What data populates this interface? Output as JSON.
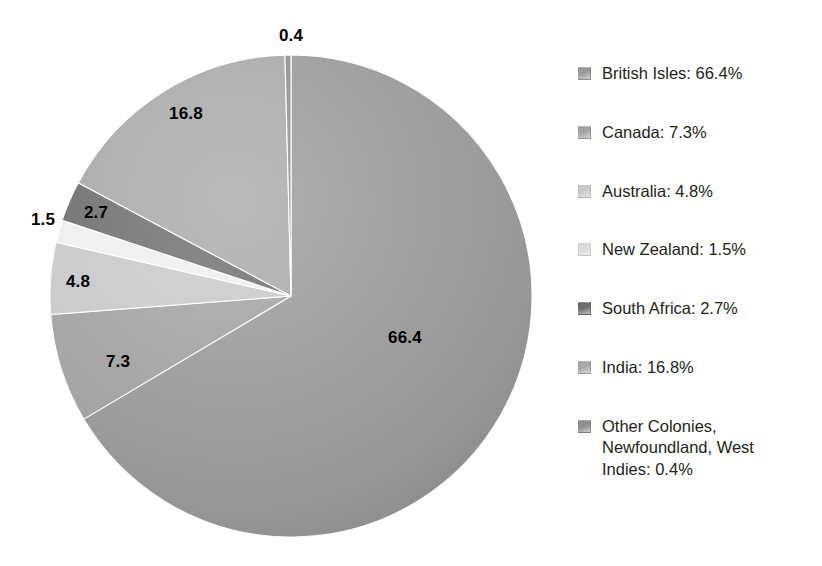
{
  "chart_data": {
    "type": "pie",
    "title": "",
    "subtitle": "",
    "xlabel": "",
    "ylabel": "",
    "legend_position": "right",
    "grid": false,
    "units": "percent",
    "start_angle_deg": 0,
    "direction": "clockwise",
    "categories": [
      "British Isles",
      "Canada",
      "Australia",
      "New Zealand",
      "South Africa",
      "India",
      "Other Colonies, Newfoundland, West Indies"
    ],
    "values": [
      66.4,
      7.3,
      4.8,
      1.5,
      2.7,
      16.8,
      0.4
    ],
    "slice_labels": [
      "66.4",
      "7.3",
      "4.8",
      "1.5",
      "2.7",
      "16.8",
      "0.4"
    ],
    "colors": [
      "#9a9a9a",
      "#a3a3a3",
      "#c9c9c9",
      "#efefef",
      "#6e6e6e",
      "#a8a8a8",
      "#8f8f8f"
    ]
  },
  "pie": {
    "slices": [
      {
        "name": "British Isles",
        "value": 66.4,
        "label": "66.4",
        "color": "#9a9a9a",
        "label_x": 405,
        "label_y": 337
      },
      {
        "name": "Canada",
        "value": 7.3,
        "label": "7.3",
        "color": "#a3a3a3",
        "label_x": 118,
        "label_y": 361
      },
      {
        "name": "Australia",
        "value": 4.8,
        "label": "4.8",
        "color": "#c9c9c9",
        "label_x": 78,
        "label_y": 281
      },
      {
        "name": "New Zealand",
        "value": 1.5,
        "label": "1.5",
        "color": "#efefef",
        "label_x": 43,
        "label_y": 219
      },
      {
        "name": "South Africa",
        "value": 2.7,
        "label": "2.7",
        "color": "#6e6e6e",
        "label_x": 96,
        "label_y": 212
      },
      {
        "name": "India",
        "value": 16.8,
        "label": "16.8",
        "color": "#a8a8a8",
        "label_x": 186,
        "label_y": 113
      },
      {
        "name": "Other Colonies, Newfoundland, West Indies",
        "value": 0.4,
        "label": "0.4",
        "color": "#8f8f8f",
        "label_x": 291,
        "label_y": 35
      }
    ]
  },
  "legend": {
    "items": [
      {
        "label": "British Isles: 66.4%",
        "color": "#9a9a9a"
      },
      {
        "label": "Canada: 7.3%",
        "color": "#a3a3a3"
      },
      {
        "label": "Australia: 4.8%",
        "color": "#c9c9c9"
      },
      {
        "label": "New Zealand: 1.5%",
        "color": "#dcdcdc"
      },
      {
        "label": "South Africa: 2.7%",
        "color": "#6e6e6e"
      },
      {
        "label": "India: 16.8%",
        "color": "#a8a8a8"
      },
      {
        "label": "Other Colonies,\nNewfoundland, West\nIndies: 0.4%",
        "color": "#8f8f8f"
      }
    ]
  }
}
